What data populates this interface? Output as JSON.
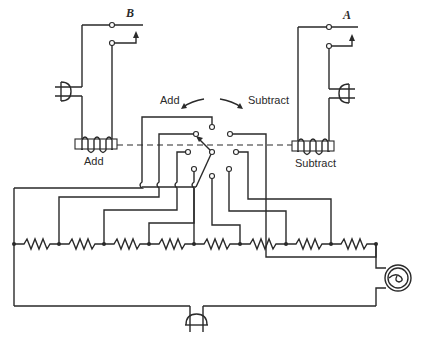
{
  "diagram": {
    "title": "",
    "type": "electrical schematic",
    "labels": {
      "relay_b": "B",
      "relay_a": "A",
      "direction_add": "Add",
      "direction_subtract": "Subtract",
      "coil_add": "Add",
      "coil_subtract": "Subtract"
    },
    "components": {
      "resistor_count": 8,
      "junction_nodes": 9,
      "switch_contacts": 9,
      "lamp": "indicator-lamp",
      "plugs": 3
    },
    "colors": {
      "ink": "#2a2a2a",
      "background": "#ffffff"
    }
  }
}
